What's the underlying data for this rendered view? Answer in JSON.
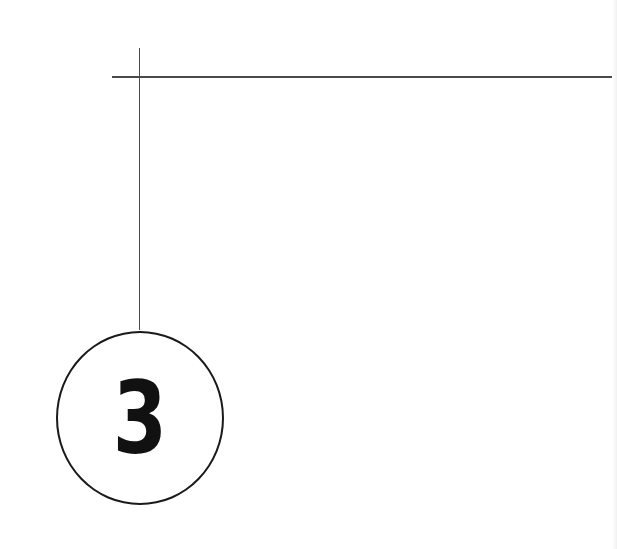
{
  "diagram": {
    "callout": {
      "number": "3",
      "shape": "circle",
      "stroke_color": "#1a1a1a",
      "text_color": "#111111"
    },
    "leader_lines": {
      "horizontal": {
        "from_x": 112,
        "to_x": 612,
        "y": 77
      },
      "vertical": {
        "x": 139,
        "from_y": 48,
        "to_y": 330
      },
      "color": "#4a4a4a"
    },
    "background": "#ffffff"
  }
}
